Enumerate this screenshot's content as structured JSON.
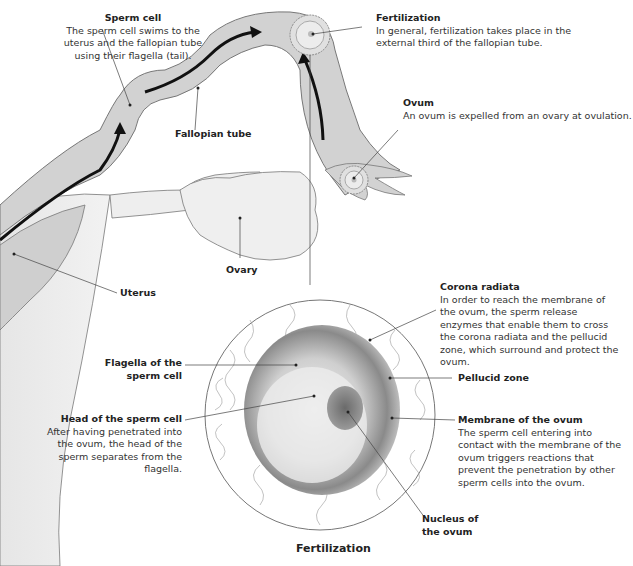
{
  "diagram": {
    "caption": "Fertilization",
    "labels": {
      "sperm_cell": {
        "title": "Sperm cell",
        "desc": "The sperm cell swims to the uterus and the fallopian tube using their flagella (tail)."
      },
      "fertilization": {
        "title": "Fertilization",
        "desc": "In general, fertilization takes place in the external third of the fallopian tube."
      },
      "ovum": {
        "title": "Ovum",
        "desc": "An ovum is expelled from an ovary at ovulation."
      },
      "fallopian_tube": {
        "title": "Fallopian tube"
      },
      "ovary": {
        "title": "Ovary"
      },
      "uterus": {
        "title": "Uterus"
      },
      "corona_radiata": {
        "title": "Corona radiata",
        "desc": "In order to reach the membrane of the ovum, the sperm release enzymes that enable them to cross the corona radiata and the pellucid zone, which surround and protect the ovum."
      },
      "pellucid_zone": {
        "title": "Pellucid zone"
      },
      "flagella": {
        "title": "Flagella of the sperm cell"
      },
      "head_sperm": {
        "title": "Head of the sperm cell",
        "desc": "After having penetrated into the ovum, the head of the sperm separates from the flagella."
      },
      "membrane_ovum": {
        "title": "Membrane of the ovum",
        "desc": "The sperm cell entering into contact with the membrane of the ovum triggers reactions that prevent  the penetration by other sperm cells into the ovum."
      },
      "nucleus_ovum": {
        "title": "Nucleus of the ovum"
      }
    }
  }
}
